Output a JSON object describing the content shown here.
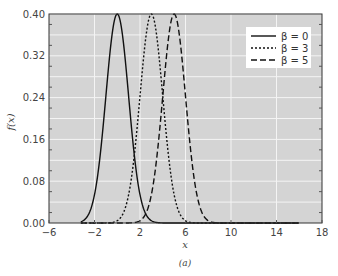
{
  "chart_data": {
    "type": "line",
    "title": "",
    "caption": "(a)",
    "xlabel": "x",
    "ylabel": "f(x)",
    "xlim": [
      -6,
      18
    ],
    "ylim": [
      0,
      0.4
    ],
    "xticks": [
      "-6",
      "-2",
      "2",
      "6",
      "10",
      "14",
      "18"
    ],
    "yticks": [
      "0.00",
      "0.08",
      "0.16",
      "0.24",
      "0.32",
      "0.40"
    ],
    "grid": true,
    "legend_position": "upper right",
    "series": [
      {
        "name": "β = 0",
        "style": "solid",
        "mean": 0,
        "sd": 1,
        "peak": 0.4
      },
      {
        "name": "β = 3",
        "style": "dotted",
        "mean": 3,
        "sd": 1,
        "peak": 0.4
      },
      {
        "name": "β = 5",
        "style": "dashed",
        "mean": 5,
        "sd": 1,
        "peak": 0.4
      }
    ]
  }
}
